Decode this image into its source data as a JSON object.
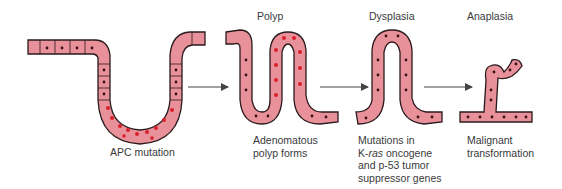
{
  "stages": [
    {
      "id": "normal",
      "title": "",
      "caption": [
        "APC mutation"
      ]
    },
    {
      "id": "polyp",
      "title": "Polyp",
      "caption": [
        "Adenomatous",
        "polyp forms"
      ]
    },
    {
      "id": "dysplasia",
      "title": "Dysplasia",
      "caption": [
        "Mutations in",
        "K-ras oncogene",
        "and p-53 tumor",
        "suppressor genes"
      ]
    },
    {
      "id": "anaplasia",
      "title": "Anaplasia",
      "caption": [
        "Malignant",
        "transformation"
      ]
    }
  ],
  "colors": {
    "tissue": "#e8919a",
    "tissue_light": "#f0aeb4",
    "outline": "#2a1a1c",
    "nucleus": "#3a1014",
    "mutant_nucleus": "#d8202c",
    "arrow": "#444444",
    "text": "#3a3a3a"
  },
  "arrows": 3
}
